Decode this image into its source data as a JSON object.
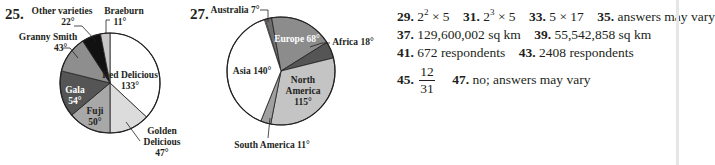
{
  "exercise_25": {
    "number": "25."
  },
  "exercise_27": {
    "number": "27."
  },
  "chart_data": [
    {
      "type": "pie",
      "title": "",
      "unit": "degrees",
      "categories": [
        "Red Delicious",
        "Golden Delicious",
        "Fuji",
        "Gala",
        "Granny Smith",
        "Other varieties",
        "Braeburn"
      ],
      "values": [
        133,
        47,
        50,
        54,
        43,
        22,
        11
      ],
      "labels": [
        "Red Delicious 133°",
        "Golden Delicious 47°",
        "Fuji 50°",
        "Gala 54°",
        "Granny Smith 43°",
        "Other varieties 22°",
        "Braeburn 11°"
      ],
      "colors": [
        "#ffffff",
        "#dcdcdc",
        "#a8a8a8",
        "#555555",
        "#8e8e8e",
        "#111111",
        "#c8c8c8"
      ]
    },
    {
      "type": "pie",
      "title": "",
      "unit": "degrees",
      "categories": [
        "Australia",
        "Europe",
        "Africa",
        "North America",
        "South America",
        "Asia"
      ],
      "values": [
        7,
        68,
        18,
        115,
        11,
        140
      ],
      "labels": [
        "Australia 7°",
        "Europe 68°",
        "Africa 18°",
        "North America 115°",
        "South America 11°",
        "Asia 140°"
      ],
      "colors": [
        "#6e6e6e",
        "#8c8c8c",
        "#555555",
        "#c4c4c4",
        "#a0a0a0",
        "#ffffff"
      ]
    }
  ],
  "pie1_labels": {
    "red_delicious_1": "Red Delicious",
    "red_delicious_2": "133°",
    "golden_1": "Golden",
    "golden_2": "Delicious",
    "golden_3": "47°",
    "fuji_1": "Fuji",
    "fuji_2": "50°",
    "gala_1": "Gala",
    "gala_2": "54°",
    "granny_1": "Granny Smith",
    "granny_2": "43°",
    "other_1": "Other varieties",
    "other_2": "22°",
    "braeburn_1": "Braeburn",
    "braeburn_2": "11°"
  },
  "pie2_labels": {
    "australia": "Australia 7°",
    "europe": "Europe 68°",
    "africa": "Africa 18°",
    "north_1": "North",
    "north_2": "America",
    "north_3": "115°",
    "south": "South America 11°",
    "asia": "Asia 140°"
  },
  "answers": [
    {
      "num": "29.",
      "text_base": "2",
      "text_sup": "2",
      "text_rest": " × 5"
    },
    {
      "num": "31.",
      "text_base": "2",
      "text_sup": "3",
      "text_rest": " × 5"
    },
    {
      "num": "33.",
      "text": "5 × 17"
    },
    {
      "num": "35.",
      "text": "answers may vary"
    },
    {
      "num": "37.",
      "text": "129,600,002 sq km"
    },
    {
      "num": "39.",
      "text": "55,542,858 sq km"
    },
    {
      "num": "41.",
      "text": "672 respondents"
    },
    {
      "num": "43.",
      "text": "2408 respondents"
    },
    {
      "num": "45.",
      "numerator": "12",
      "denominator": "31"
    },
    {
      "num": "47.",
      "text": "no; answers may vary"
    }
  ]
}
